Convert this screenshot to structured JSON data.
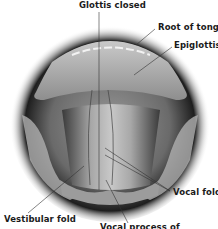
{
  "figure": {
    "labels": {
      "glottis_closed": "Glottis closed",
      "root_of_tongue": "Root of tongue",
      "epiglottis": "Epiglottis",
      "vocal_folds": "Vocal folds",
      "vestibular_fold": "Vestibular fold",
      "vocal_process": "Vocal process of"
    }
  }
}
